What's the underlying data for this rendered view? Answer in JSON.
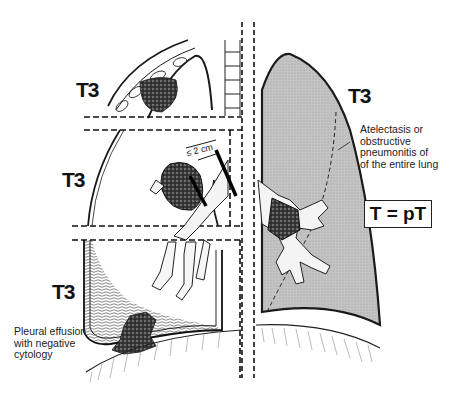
{
  "figure": {
    "colors": {
      "ink": "#1a1a1a",
      "lung_fill": "#bdbdbd",
      "background": "#ffffff"
    }
  },
  "left_panel": {
    "labels": {
      "top": "T3",
      "middle": "T3",
      "bottom": "T3"
    },
    "dimension_label": "≤ 2 cm",
    "pleural_note": "Pleural effusion\nwith negative\ncytology"
  },
  "right_panel": {
    "label": "T3",
    "atelectasis_note": "Atelectasis or\nobstructive\npneumonitis of\nof the entire lung",
    "formula": "T = pT"
  }
}
